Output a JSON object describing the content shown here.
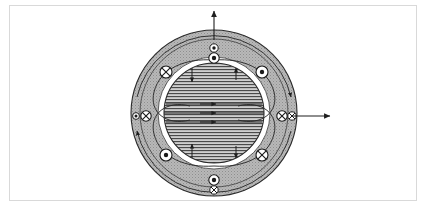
{
  "figure": {
    "caption": "",
    "frame": {
      "border_color": "#d9d9d9",
      "background": "#ffffff"
    }
  },
  "colors": {
    "stator_fill": "#b3b3b3",
    "rotor_fill": "#c4c4c4",
    "airgap_fill": "#ffffff",
    "outline": "#1a1a1a",
    "hatch_line": "#3a3a3a",
    "flux_line": "#2b2b2b",
    "frame_border": "#d9d9d9"
  },
  "geometry": {
    "center_x": 214,
    "center_y": 113,
    "outer_radius": 83,
    "stator_back_radius": 74,
    "airgap_outer_radius": 56,
    "airgap_inner_radius": 50,
    "rotor_radius": 50
  },
  "labels": {
    "stator_region": "stator yoke",
    "rotor_region": "rotor core",
    "airgap_region": "air gap",
    "title": ""
  },
  "conductors": {
    "quadrant": [
      {
        "id": "top-left",
        "symbol": "cross",
        "x": 166,
        "y": 72,
        "r": 6.0
      },
      {
        "id": "top-right",
        "symbol": "dot",
        "x": 262,
        "y": 72,
        "r": 6.0
      },
      {
        "id": "bottom-left",
        "symbol": "dot",
        "x": 166,
        "y": 155,
        "r": 6.0
      },
      {
        "id": "bottom-right",
        "symbol": "cross",
        "x": 262,
        "y": 155,
        "r": 6.0
      }
    ],
    "axis": [
      {
        "id": "top-outer",
        "symbol": "dot",
        "x": 214,
        "y": 48,
        "r": 4.2
      },
      {
        "id": "top-inner",
        "symbol": "dot",
        "x": 214,
        "y": 58,
        "r": 5.2
      },
      {
        "id": "bottom-outer",
        "symbol": "dot",
        "x": 214,
        "y": 180,
        "r": 5.2
      },
      {
        "id": "bottom-inner",
        "symbol": "cross",
        "x": 214,
        "y": 190,
        "r": 4.2
      },
      {
        "id": "left-outer",
        "symbol": "dot",
        "x": 136,
        "y": 116,
        "r": 3.4
      },
      {
        "id": "left-inner",
        "symbol": "cross",
        "x": 146,
        "y": 116,
        "r": 5.2
      },
      {
        "id": "right-inner",
        "symbol": "cross",
        "x": 282,
        "y": 116,
        "r": 5.2
      },
      {
        "id": "right-outer",
        "symbol": "cross",
        "x": 292,
        "y": 116,
        "r": 4.2
      }
    ]
  },
  "field_lines": {
    "core_horizontal_count": 3,
    "core_lines": [
      {
        "id": "core-line-upper",
        "y": 104,
        "x1": 166,
        "x2": 262,
        "arrow_x": 212
      },
      {
        "id": "core-line-middle",
        "y": 113,
        "x1": 164,
        "x2": 264,
        "arrow_x": 212
      },
      {
        "id": "core-line-lower",
        "y": 122,
        "x1": 166,
        "x2": 262,
        "arrow_x": 212
      }
    ],
    "loop_count": 4
  },
  "vectors": [
    {
      "id": "flux-vector-up",
      "direction": "up",
      "from_x": 214,
      "from_y": 40,
      "to_x": 214,
      "to_y": 10,
      "label": ""
    },
    {
      "id": "flux-vector-right",
      "direction": "right",
      "from_x": 290,
      "from_y": 116,
      "to_x": 330,
      "to_y": 116,
      "label": ""
    }
  ]
}
